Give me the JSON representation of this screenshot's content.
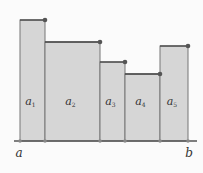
{
  "diagram": {
    "title": "",
    "axis": {
      "y": 141,
      "x_start": 14,
      "x_end": 197,
      "color": "#555555",
      "left_label": "a",
      "right_label": "b"
    },
    "fill_color": "#d6d6d6",
    "stroke_color": "#777777",
    "top_line_color": "#444444",
    "dot_color": "#555555",
    "partition_points": [
      20,
      45,
      100,
      125,
      160,
      188
    ],
    "rectangles": [
      {
        "label": "a",
        "sub": "1",
        "x0": 20,
        "x1": 45,
        "top": 20
      },
      {
        "label": "a",
        "sub": "2",
        "x0": 45,
        "x1": 100,
        "top": 42
      },
      {
        "label": "a",
        "sub": "3",
        "x0": 100,
        "x1": 125,
        "top": 62
      },
      {
        "label": "a",
        "sub": "4",
        "x0": 125,
        "x1": 160,
        "top": 74
      },
      {
        "label": "a",
        "sub": "5",
        "x0": 160,
        "x1": 188,
        "top": 46
      }
    ]
  }
}
